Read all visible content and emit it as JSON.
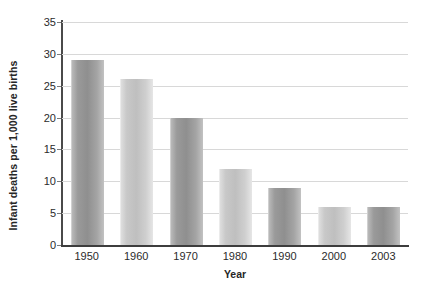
{
  "chart_data": {
    "type": "bar",
    "title": "",
    "xlabel": "Year",
    "ylabel": "Infant deaths per 1,000 live births",
    "categories": [
      "1950",
      "1960",
      "1970",
      "1980",
      "1990",
      "2000",
      "2003"
    ],
    "values": [
      29,
      26,
      20,
      12,
      9,
      6,
      6
    ],
    "ylim": [
      0,
      35
    ],
    "ytick_labels": [
      "0",
      "5",
      "10",
      "15",
      "20",
      "25",
      "30",
      "35"
    ],
    "ytick_values": [
      0,
      5,
      10,
      15,
      20,
      25,
      30,
      35
    ],
    "grid": true,
    "legend": "none",
    "series": [
      {
        "name": "Infant deaths per 1,000 live births",
        "values": [
          29,
          26,
          20,
          12,
          9,
          6,
          6
        ]
      }
    ],
    "bar_shades": [
      "dark",
      "light",
      "dark",
      "light",
      "dark",
      "light",
      "dark"
    ],
    "colors": {
      "bar_dark": "#9a9a9a",
      "bar_light": "#cbcbcb",
      "gridline": "#d8d8d8",
      "axis": "#3d3d3d",
      "text": "#2b2b2b",
      "background": "#ffffff"
    }
  }
}
